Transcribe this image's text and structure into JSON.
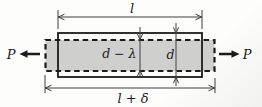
{
  "diagram": {
    "labels": {
      "force_left": "P",
      "force_right": "P",
      "length_original": "l",
      "length_elongated": "l + δ",
      "depth_contracted": "d − λ",
      "depth_original": "d"
    },
    "colors": {
      "bar_fill": "#cfcfcd",
      "ink": "#1b1b1b",
      "dim_line": "#3f3f3f",
      "background": "#fdfdfc"
    }
  }
}
